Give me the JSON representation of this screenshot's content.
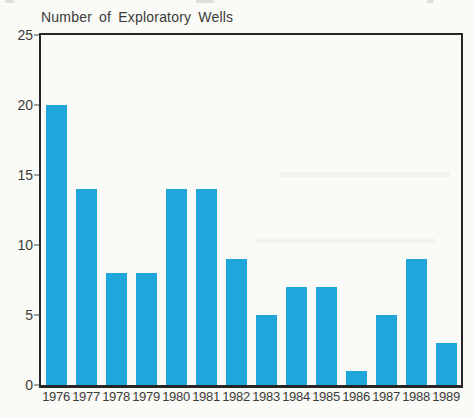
{
  "chart_data": {
    "type": "bar",
    "title": "Number of Exploratory Wells",
    "categories": [
      "1976",
      "1977",
      "1978",
      "1979",
      "1980",
      "1981",
      "1982",
      "1983",
      "1984",
      "1985",
      "1986",
      "1987",
      "1988",
      "1989"
    ],
    "values": [
      20,
      14,
      8,
      8,
      14,
      14,
      9,
      5,
      7,
      7,
      1,
      5,
      9,
      3
    ],
    "xlabel": "",
    "ylabel": "",
    "ylim": [
      0,
      25
    ],
    "yticks": [
      0,
      5,
      10,
      15,
      20,
      25
    ],
    "grid": false,
    "legend": null,
    "bar_color": "#1FA6DC",
    "axis_color": "#262626",
    "text_color": "#3a3a3a",
    "background_color": "#FAFAF6"
  }
}
